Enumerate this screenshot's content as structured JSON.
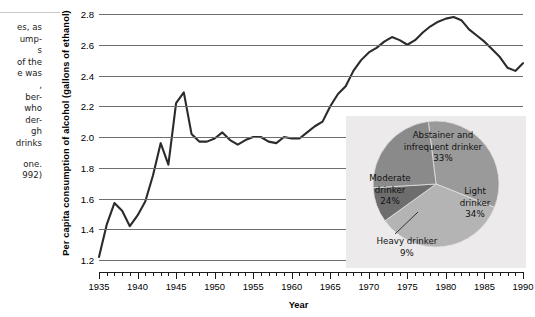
{
  "side_note": {
    "lines": [
      "es, as",
      "ump-",
      "s",
      "of the",
      "e was",
      ",",
      "ber-",
      "who",
      "der-",
      "gh",
      "drinks"
    ],
    "lines2": [
      "one.",
      "992)"
    ]
  },
  "chart_data": {
    "type": "line",
    "title": "",
    "xlabel": "Year",
    "ylabel": "Per capita consumption of alcohol (gallons of ethanol)",
    "xlim": [
      1935,
      1990
    ],
    "ylim": [
      1.2,
      2.8
    ],
    "grid": true,
    "legend": "none",
    "ytick_labels": [
      "2.8",
      "2.6",
      "2.4",
      "2.2",
      "2.0",
      "1.8",
      "1.6",
      "1.4",
      "1.2"
    ],
    "ytick_values": [
      2.8,
      2.6,
      2.4,
      2.2,
      2.0,
      1.8,
      1.6,
      1.4,
      1.2
    ],
    "xtick_labels": [
      "1935",
      "1940",
      "1945",
      "1950",
      "1955",
      "1960",
      "1965",
      "1970",
      "1975",
      "1980",
      "1985",
      "1990"
    ],
    "xtick_values": [
      1935,
      1940,
      1945,
      1950,
      1955,
      1960,
      1965,
      1970,
      1975,
      1980,
      1985,
      1990
    ],
    "x": [
      1935,
      1936,
      1937,
      1938,
      1939,
      1940,
      1941,
      1942,
      1943,
      1944,
      1945,
      1946,
      1947,
      1948,
      1949,
      1950,
      1951,
      1952,
      1953,
      1954,
      1955,
      1956,
      1957,
      1958,
      1959,
      1960,
      1961,
      1962,
      1963,
      1964,
      1965,
      1966,
      1967,
      1968,
      1969,
      1970,
      1971,
      1972,
      1973,
      1974,
      1975,
      1976,
      1977,
      1978,
      1979,
      1980,
      1981,
      1982,
      1983,
      1984,
      1985,
      1986,
      1987,
      1988,
      1989,
      1990
    ],
    "y": [
      1.22,
      1.43,
      1.57,
      1.52,
      1.42,
      1.49,
      1.58,
      1.75,
      1.96,
      1.82,
      2.22,
      2.29,
      2.02,
      1.97,
      1.97,
      1.99,
      2.03,
      1.98,
      1.95,
      1.98,
      2.0,
      2.0,
      1.97,
      1.96,
      2.0,
      1.99,
      1.99,
      2.03,
      2.07,
      2.1,
      2.2,
      2.28,
      2.33,
      2.43,
      2.5,
      2.55,
      2.58,
      2.62,
      2.65,
      2.63,
      2.6,
      2.63,
      2.68,
      2.72,
      2.75,
      2.77,
      2.78,
      2.76,
      2.7,
      2.66,
      2.62,
      2.57,
      2.52,
      2.45,
      2.43,
      2.48
    ],
    "series_color": "#2b2b2b"
  },
  "pie_inset": {
    "chart_data": {
      "type": "pie",
      "title": "",
      "labels": [
        "Abstainer and infrequent drinker",
        "Light drinker",
        "Heavy drinker",
        "Moderate drinker"
      ],
      "values": [
        33,
        34,
        9,
        24
      ],
      "value_labels": [
        "33%",
        "34%",
        "9%",
        "24%"
      ],
      "colors": [
        "#9a9a9a",
        "#b4b4b4",
        "#6d6d6d",
        "#8a8a8a"
      ],
      "background": "#eceaea"
    },
    "labels": {
      "abstainer": {
        "name1": "Abstainer and",
        "name2": "infrequent drinker",
        "pct": "33%"
      },
      "light": {
        "name1": "Light",
        "name2": "drinker",
        "pct": "34%"
      },
      "moderate": {
        "name1": "Moderate",
        "name2": "drinker",
        "pct": "24%"
      },
      "heavy": {
        "name1": "Heavy drinker",
        "pct": "9%"
      }
    }
  }
}
